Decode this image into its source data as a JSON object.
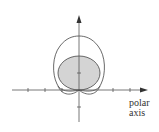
{
  "figure": {
    "type": "polar-graph",
    "axis_label_line1": "polar",
    "axis_label_line2": "axis",
    "colors": {
      "axis": "#555555",
      "curve": "#444444",
      "shade": "#d4d4d4",
      "background": "#ffffff"
    },
    "curves": [
      {
        "name": "outer-curve",
        "description": "large closed curve with two small loops near the pole"
      },
      {
        "name": "shaded-circle",
        "description": "shaded circle tangent to polar axis at the pole"
      }
    ],
    "horizontal_ticks": 5,
    "vertical_ticks": 2
  }
}
